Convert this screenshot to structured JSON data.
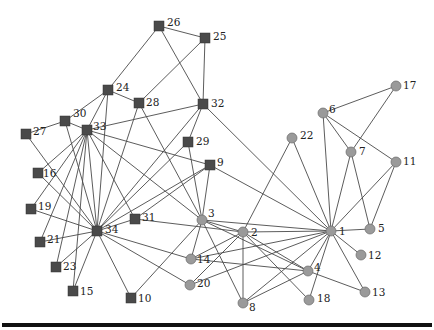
{
  "figure": {
    "shape_legend": {
      "square": "community A (node 34 faction)",
      "circle": "community B (node 1 faction)"
    },
    "colors": {
      "square_fill": "#4a4a4a",
      "circle_fill": "#9a9a9a",
      "edge": "#4a4a4a",
      "rule": "#111111"
    }
  },
  "nodes": [
    {
      "id": "1",
      "x": 331,
      "y": 231,
      "shape": "circle",
      "lx": 8,
      "ly": 4
    },
    {
      "id": "2",
      "x": 243,
      "y": 232,
      "shape": "circle",
      "lx": 8,
      "ly": 4
    },
    {
      "id": "3",
      "x": 202,
      "y": 220,
      "shape": "circle",
      "lx": 6,
      "ly": -3
    },
    {
      "id": "4",
      "x": 308,
      "y": 271,
      "shape": "circle",
      "lx": 6,
      "ly": 0
    },
    {
      "id": "5",
      "x": 370,
      "y": 229,
      "shape": "circle",
      "lx": 8,
      "ly": 3
    },
    {
      "id": "6",
      "x": 323,
      "y": 113,
      "shape": "circle",
      "lx": 6,
      "ly": 0
    },
    {
      "id": "7",
      "x": 351,
      "y": 152,
      "shape": "circle",
      "lx": 8,
      "ly": 3
    },
    {
      "id": "8",
      "x": 243,
      "y": 303,
      "shape": "circle",
      "lx": 6,
      "ly": 8
    },
    {
      "id": "9",
      "x": 210,
      "y": 165,
      "shape": "square",
      "lx": 7,
      "ly": 1
    },
    {
      "id": "10",
      "x": 131,
      "y": 298,
      "shape": "square",
      "lx": 7,
      "ly": 4
    },
    {
      "id": "11",
      "x": 396,
      "y": 162,
      "shape": "circle",
      "lx": 7,
      "ly": 3
    },
    {
      "id": "12",
      "x": 361,
      "y": 255,
      "shape": "circle",
      "lx": 7,
      "ly": 4
    },
    {
      "id": "13",
      "x": 365,
      "y": 292,
      "shape": "circle",
      "lx": 7,
      "ly": 4
    },
    {
      "id": "14",
      "x": 191,
      "y": 259,
      "shape": "circle",
      "lx": 6,
      "ly": 4
    },
    {
      "id": "15",
      "x": 73,
      "y": 291,
      "shape": "square",
      "lx": 7,
      "ly": 4
    },
    {
      "id": "16",
      "x": 38,
      "y": 173,
      "shape": "square",
      "lx": 5,
      "ly": 4
    },
    {
      "id": "17",
      "x": 396,
      "y": 86,
      "shape": "circle",
      "lx": 7,
      "ly": 3
    },
    {
      "id": "18",
      "x": 309,
      "y": 300,
      "shape": "circle",
      "lx": 8,
      "ly": 2
    },
    {
      "id": "19",
      "x": 31,
      "y": 209,
      "shape": "square",
      "lx": 7,
      "ly": 1
    },
    {
      "id": "20",
      "x": 190,
      "y": 285,
      "shape": "circle",
      "lx": 7,
      "ly": 2
    },
    {
      "id": "21",
      "x": 40,
      "y": 242,
      "shape": "square",
      "lx": 7,
      "ly": 1
    },
    {
      "id": "22",
      "x": 292,
      "y": 138,
      "shape": "circle",
      "lx": 8,
      "ly": 1
    },
    {
      "id": "23",
      "x": 56,
      "y": 267,
      "shape": "square",
      "lx": 7,
      "ly": 3
    },
    {
      "id": "24",
      "x": 108,
      "y": 90,
      "shape": "square",
      "lx": 8,
      "ly": 1
    },
    {
      "id": "25",
      "x": 205,
      "y": 38,
      "shape": "square",
      "lx": 8,
      "ly": 2
    },
    {
      "id": "26",
      "x": 159,
      "y": 26,
      "shape": "square",
      "lx": 8,
      "ly": 0
    },
    {
      "id": "27",
      "x": 26,
      "y": 134,
      "shape": "square",
      "lx": 7,
      "ly": 1
    },
    {
      "id": "28",
      "x": 139,
      "y": 103,
      "shape": "square",
      "lx": 7,
      "ly": 3
    },
    {
      "id": "29",
      "x": 188,
      "y": 142,
      "shape": "square",
      "lx": 8,
      "ly": 3
    },
    {
      "id": "30",
      "x": 65,
      "y": 121,
      "shape": "square",
      "lx": 8,
      "ly": -4
    },
    {
      "id": "31",
      "x": 135,
      "y": 219,
      "shape": "square",
      "lx": 7,
      "ly": 2
    },
    {
      "id": "32",
      "x": 203,
      "y": 104,
      "shape": "square",
      "lx": 8,
      "ly": 3
    },
    {
      "id": "33",
      "x": 87,
      "y": 130,
      "shape": "square",
      "lx": 6,
      "ly": 0
    },
    {
      "id": "34",
      "x": 97,
      "y": 231,
      "shape": "square",
      "lx": 8,
      "ly": 2
    }
  ],
  "edges": [
    [
      "1",
      "2"
    ],
    [
      "1",
      "3"
    ],
    [
      "1",
      "4"
    ],
    [
      "1",
      "5"
    ],
    [
      "1",
      "6"
    ],
    [
      "1",
      "7"
    ],
    [
      "1",
      "8"
    ],
    [
      "1",
      "9"
    ],
    [
      "1",
      "11"
    ],
    [
      "1",
      "12"
    ],
    [
      "1",
      "13"
    ],
    [
      "1",
      "14"
    ],
    [
      "1",
      "18"
    ],
    [
      "1",
      "20"
    ],
    [
      "1",
      "22"
    ],
    [
      "1",
      "32"
    ],
    [
      "2",
      "3"
    ],
    [
      "2",
      "4"
    ],
    [
      "2",
      "8"
    ],
    [
      "2",
      "14"
    ],
    [
      "2",
      "18"
    ],
    [
      "2",
      "20"
    ],
    [
      "2",
      "22"
    ],
    [
      "2",
      "31"
    ],
    [
      "3",
      "4"
    ],
    [
      "3",
      "8"
    ],
    [
      "3",
      "9"
    ],
    [
      "3",
      "10"
    ],
    [
      "3",
      "14"
    ],
    [
      "3",
      "28"
    ],
    [
      "3",
      "29"
    ],
    [
      "3",
      "33"
    ],
    [
      "4",
      "8"
    ],
    [
      "4",
      "13"
    ],
    [
      "4",
      "14"
    ],
    [
      "5",
      "7"
    ],
    [
      "5",
      "11"
    ],
    [
      "6",
      "7"
    ],
    [
      "6",
      "11"
    ],
    [
      "6",
      "17"
    ],
    [
      "7",
      "17"
    ],
    [
      "9",
      "31"
    ],
    [
      "9",
      "33"
    ],
    [
      "9",
      "34"
    ],
    [
      "10",
      "34"
    ],
    [
      "14",
      "34"
    ],
    [
      "15",
      "33"
    ],
    [
      "15",
      "34"
    ],
    [
      "16",
      "33"
    ],
    [
      "16",
      "34"
    ],
    [
      "19",
      "33"
    ],
    [
      "19",
      "34"
    ],
    [
      "20",
      "34"
    ],
    [
      "21",
      "33"
    ],
    [
      "21",
      "34"
    ],
    [
      "23",
      "33"
    ],
    [
      "23",
      "34"
    ],
    [
      "24",
      "26"
    ],
    [
      "24",
      "28"
    ],
    [
      "24",
      "30"
    ],
    [
      "24",
      "33"
    ],
    [
      "24",
      "34"
    ],
    [
      "25",
      "26"
    ],
    [
      "25",
      "28"
    ],
    [
      "25",
      "32"
    ],
    [
      "26",
      "32"
    ],
    [
      "27",
      "30"
    ],
    [
      "27",
      "34"
    ],
    [
      "28",
      "34"
    ],
    [
      "29",
      "32"
    ],
    [
      "29",
      "34"
    ],
    [
      "30",
      "33"
    ],
    [
      "30",
      "34"
    ],
    [
      "31",
      "33"
    ],
    [
      "31",
      "34"
    ],
    [
      "32",
      "33"
    ],
    [
      "32",
      "34"
    ],
    [
      "33",
      "34"
    ]
  ]
}
